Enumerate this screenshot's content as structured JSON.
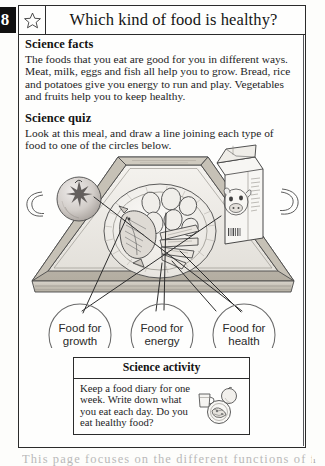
{
  "document": {
    "chapter_number": "8",
    "title": "Which kind of food is healthy?",
    "star_icon": "star-outline-icon",
    "page_number": "1",
    "bottom_cropped_text": "This page focuses on the different functions of food"
  },
  "science_facts": {
    "heading": "Science facts",
    "paragraph": "The foods that you eat are good for you in different ways. Meat, milk, eggs and fish all help you to grow. Bread, rice and potatoes give you energy to run and play. Vegetables and fruits help you to keep healthy."
  },
  "science_quiz": {
    "heading": "Science quiz",
    "paragraph": "Look at this meal, and draw a line joining each type of food to one of the circles below."
  },
  "illustration": {
    "name": "meal-tray-illustration",
    "tray": "serving-tray-with-handles",
    "foods": [
      {
        "name": "apple",
        "label": "apple"
      },
      {
        "name": "plate",
        "label": "plate"
      },
      {
        "name": "fish",
        "label": "fish"
      },
      {
        "name": "potatoes",
        "label": "potatoes"
      },
      {
        "name": "carrots",
        "label": "carrots"
      },
      {
        "name": "milk-carton",
        "label": "milk carton"
      }
    ],
    "circles": [
      {
        "line1": "Food for",
        "line2": "growth"
      },
      {
        "line1": "Food for",
        "line2": "energy"
      },
      {
        "line1": "Food for",
        "line2": "health"
      }
    ]
  },
  "science_activity": {
    "heading": "Science activity",
    "text": "Keep a food diary for one week. Write down what you eat each day. Do you eat healthy food?",
    "icon": "food-plate-cup-apple-icon"
  },
  "colors": {
    "ink": "#1a1a1a",
    "paper": "#fefefd",
    "rule": "#2b2b2b",
    "tab_bg": "#111111",
    "tab_fg": "#ffffff",
    "line_art": "#4a4a4a"
  }
}
